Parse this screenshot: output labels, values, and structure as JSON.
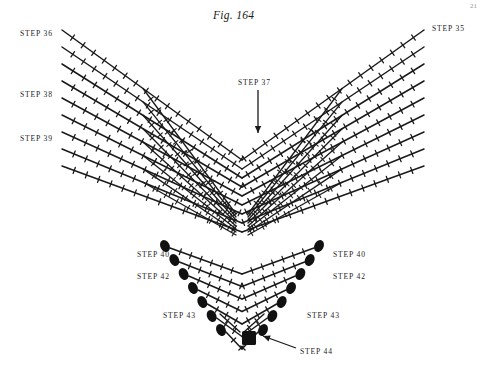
{
  "figure": {
    "title": "Fig. 164",
    "page_number": "21",
    "background_color": "#ffffff",
    "ink_color": "#1a1a1a"
  },
  "labels": {
    "top_left": "STEP 36",
    "top_right": "STEP 35",
    "mid_left": "STEP 38",
    "lower_left": "STEP 39",
    "center_pointer": "STEP 37",
    "bead_left_upper": "STEP 40",
    "bead_left_lower": "STEP 42",
    "bead_right_upper": "STEP 40",
    "bead_right_lower": "STEP 42",
    "bead_left_bottom": "STEP 43",
    "bead_right_bottom": "STEP 43",
    "bottom_center": "STEP 44"
  },
  "label_positions": [
    {
      "name": "step-36",
      "text": "STEP 36",
      "x": 20,
      "y": 29
    },
    {
      "name": "step-35",
      "text": "STEP 35",
      "x": 432,
      "y": 24
    },
    {
      "name": "step-38",
      "text": "STEP 38",
      "x": 20,
      "y": 90
    },
    {
      "name": "step-39",
      "text": "STEP 39",
      "x": 20,
      "y": 134
    },
    {
      "name": "step-37",
      "text": "STEP 37",
      "x": 238,
      "y": 78
    },
    {
      "name": "step-40-left",
      "text": "STEP 40",
      "x": 137,
      "y": 250
    },
    {
      "name": "step-42-left",
      "text": "STEP 42",
      "x": 137,
      "y": 272
    },
    {
      "name": "step-40-right",
      "text": "STEP 40",
      "x": 333,
      "y": 250
    },
    {
      "name": "step-42-right",
      "text": "STEP 42",
      "x": 333,
      "y": 272
    },
    {
      "name": "step-43-left",
      "text": "STEP 43",
      "x": 163,
      "y": 311
    },
    {
      "name": "step-43-right",
      "text": "STEP 43",
      "x": 307,
      "y": 311
    },
    {
      "name": "step-44",
      "text": "STEP 44",
      "x": 300,
      "y": 347
    }
  ],
  "chart_data": {
    "type": "diagram",
    "apex": {
      "x": 242,
      "y": 232
    },
    "upper_lattice": {
      "description": "Chevron rows of beaded strands forming a V, crossing into diamond mesh near the apex",
      "row_count": 9,
      "left_origin_x": 62,
      "right_origin_x": 424,
      "top_y": 30,
      "row_spacing": 17,
      "bead_tick_spacing": 13
    },
    "lower_fringe": {
      "description": "Nested chevron rows narrowing downward, each strand end finished with a dark oval bead",
      "row_count": 7,
      "top_y": 248,
      "row_spacing": 14,
      "half_width_top": 72,
      "half_width_bottom": 16,
      "terminal_bead": "oval"
    },
    "bottom_bead": {
      "shape": "square",
      "x": 249,
      "y": 338,
      "size": 14
    },
    "pointers": [
      {
        "name": "step-37-arrow",
        "from": [
          258,
          90
        ],
        "to": [
          258,
          133
        ],
        "direction": "down"
      },
      {
        "name": "step-44-leader",
        "from": [
          296,
          348
        ],
        "to": [
          263,
          336
        ],
        "direction": "up-left"
      }
    ]
  }
}
